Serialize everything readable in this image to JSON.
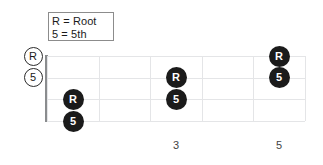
{
  "diagram": {
    "legend": {
      "lines": [
        "R = Root",
        "5 = 5th"
      ],
      "items": [
        {
          "symbol": "R",
          "meaning": "Root"
        },
        {
          "symbol": "5",
          "meaning": "5th"
        }
      ]
    },
    "colors": {
      "dot_fill": "#1b1b1b",
      "dot_text": "#ffffff",
      "open_marker_stroke": "#2b2b2b",
      "open_marker_fill": "#ffffff",
      "grid_line": "#e4e5e7",
      "nut": "#8a8c8e",
      "legend_border": "#8c8c8c",
      "background": "#ffffff",
      "label_text": "#444444"
    },
    "board": {
      "string_count": 4,
      "fret_count": 5,
      "strings": [
        {
          "index": 1,
          "y": 0
        },
        {
          "index": 2,
          "y": 21.5
        },
        {
          "index": 3,
          "y": 43
        },
        {
          "index": 4,
          "y": 65
        }
      ],
      "frets": [
        {
          "index": 0,
          "x": 0
        },
        {
          "index": 1,
          "x": 51.5
        },
        {
          "index": 2,
          "x": 103
        },
        {
          "index": 3,
          "x": 154.5
        },
        {
          "index": 4,
          "x": 206
        },
        {
          "index": 5,
          "x": 258
        }
      ]
    },
    "open_markers": [
      {
        "label": "R",
        "string": 1,
        "x": 33,
        "y": 56
      },
      {
        "label": "5",
        "string": 2,
        "x": 33,
        "y": 77.5
      }
    ],
    "notes": [
      {
        "label": "R",
        "string": 3,
        "fret": 1,
        "x": 73,
        "y": 99
      },
      {
        "label": "5",
        "string": 4,
        "fret": 1,
        "x": 73,
        "y": 121
      },
      {
        "label": "R",
        "string": 2,
        "fret": 3,
        "x": 176,
        "y": 77.5
      },
      {
        "label": "5",
        "string": 3,
        "fret": 3,
        "x": 176,
        "y": 99
      },
      {
        "label": "R",
        "string": 1,
        "fret": 5,
        "x": 279,
        "y": 56
      },
      {
        "label": "5",
        "string": 2,
        "fret": 5,
        "x": 279,
        "y": 77.5
      }
    ],
    "fret_labels": [
      {
        "text": "3",
        "x": 176,
        "y": 140
      },
      {
        "text": "5",
        "x": 279,
        "y": 140
      }
    ]
  }
}
